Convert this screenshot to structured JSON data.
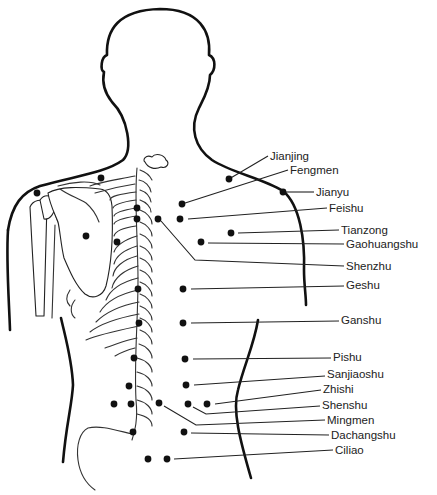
{
  "diagram": {
    "labels": [
      {
        "id": "jianjing",
        "text": "Jianjing",
        "x": 270,
        "y": 160,
        "line": [
          [
            229,
            179
          ],
          [
            268,
            156
          ]
        ],
        "dot": [
          229,
          179
        ]
      },
      {
        "id": "fengmen",
        "text": "Fengmen",
        "x": 290,
        "y": 174,
        "line": [
          [
            182,
            204
          ],
          [
            288,
            170
          ]
        ],
        "dot": [
          182,
          204
        ]
      },
      {
        "id": "jianyu",
        "text": "Jianyu",
        "x": 316,
        "y": 196,
        "line": [
          [
            283,
            192
          ],
          [
            314,
            192
          ]
        ],
        "dot": [
          283,
          192
        ]
      },
      {
        "id": "feishu",
        "text": "Feishu",
        "x": 329,
        "y": 212,
        "line": [
          [
            188,
            219
          ],
          [
            327,
            208
          ]
        ],
        "dot": [
          180,
          219
        ]
      },
      {
        "id": "tianzong",
        "text": "Tianzong",
        "x": 341,
        "y": 234,
        "line": [
          [
            238,
            233
          ],
          [
            339,
            230
          ]
        ],
        "dot": [
          231,
          233
        ]
      },
      {
        "id": "gaohuangshu",
        "text": "Gaohuangshu",
        "x": 346,
        "y": 248,
        "line": [
          [
            208,
            243
          ],
          [
            344,
            244
          ]
        ],
        "dot": [
          201,
          242
        ]
      },
      {
        "id": "shenzhu",
        "text": "Shenzhu",
        "x": 346,
        "y": 270,
        "line": [
          [
            161,
            221
          ],
          [
            195,
            260
          ],
          [
            344,
            266
          ]
        ],
        "dot": [
          158,
          219
        ]
      },
      {
        "id": "geshu",
        "text": "Geshu",
        "x": 346,
        "y": 289,
        "line": [
          [
            191,
            289
          ],
          [
            344,
            286
          ]
        ],
        "dot": [
          183,
          289
        ]
      },
      {
        "id": "ganshu",
        "text": "Ganshu",
        "x": 341,
        "y": 324,
        "line": [
          [
            191,
            323
          ],
          [
            339,
            321
          ]
        ],
        "dot": [
          183,
          323
        ]
      },
      {
        "id": "pishu",
        "text": "Pishu",
        "x": 333,
        "y": 361,
        "line": [
          [
            193,
            359
          ],
          [
            331,
            358
          ]
        ],
        "dot": [
          185,
          359
        ]
      },
      {
        "id": "sanjiaoshu",
        "text": "Sanjiaoshu",
        "x": 327,
        "y": 378,
        "line": [
          [
            194,
            385
          ],
          [
            325,
            376
          ]
        ],
        "dot": [
          186,
          385
        ]
      },
      {
        "id": "zhishi",
        "text": "Zhishi",
        "x": 323,
        "y": 393,
        "line": [
          [
            215,
            404
          ],
          [
            321,
            390
          ]
        ],
        "dot": [
          207,
          404
        ]
      },
      {
        "id": "shenshu",
        "text": "Shenshu",
        "x": 322,
        "y": 409,
        "line": [
          [
            193,
            407
          ],
          [
            206,
            414
          ],
          [
            320,
            406
          ]
        ],
        "dot": [
          188,
          404
        ]
      },
      {
        "id": "mingmen",
        "text": "Mingmen",
        "x": 327,
        "y": 424,
        "line": [
          [
            164,
            406
          ],
          [
            196,
            425
          ],
          [
            325,
            420
          ]
        ],
        "dot": [
          159,
          403
        ]
      },
      {
        "id": "dachangshu",
        "text": "Dachangshu",
        "x": 331,
        "y": 439,
        "line": [
          [
            191,
            433
          ],
          [
            329,
            435
          ]
        ],
        "dot": [
          184,
          432
        ]
      },
      {
        "id": "ciliao",
        "text": "Ciliao",
        "x": 335,
        "y": 454,
        "line": [
          [
            174,
            459
          ],
          [
            333,
            450
          ]
        ],
        "dot": [
          167,
          459
        ]
      }
    ],
    "extra_points": [
      [
        101,
        178
      ],
      [
        37,
        193
      ],
      [
        86,
        236
      ],
      [
        117,
        242
      ],
      [
        137,
        208
      ],
      [
        137,
        219
      ],
      [
        138,
        289
      ],
      [
        139,
        323
      ],
      [
        134,
        358
      ],
      [
        129,
        386
      ],
      [
        131,
        404
      ],
      [
        114,
        404
      ],
      [
        133,
        432
      ],
      [
        148,
        459
      ]
    ]
  }
}
